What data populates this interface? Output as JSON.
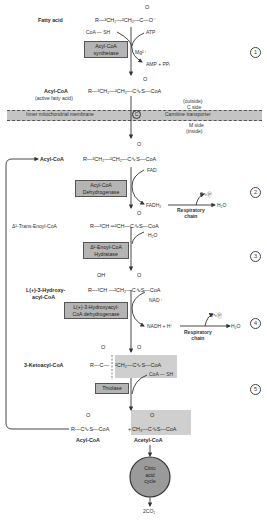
{
  "steps": [
    "1",
    "2",
    "3",
    "4",
    "5"
  ],
  "compounds": {
    "fatty_acid": {
      "label": "Fatty acid",
      "formula": "R—³CH₂—²CH₂—C—O⁻",
      "carbonyl": "O"
    },
    "acyl_coa_1": {
      "label": "Acyl-CoA",
      "sublabel": "(active fatty acid)",
      "formula": "R—³CH₂—²CH₂—C∿S—CoA",
      "carbonyl": "O"
    },
    "acyl_coa_2": {
      "label": "Acyl-CoA",
      "formula": "R—³CH₂—²CH₂—C∿S—CoA",
      "carbonyl": "O"
    },
    "trans_enoyl": {
      "label": "Δ²-Trans-Enoyl-CoA",
      "formula": "R—³CH ═²CH—C∿S—CoA",
      "carbonyl": "O"
    },
    "hydroxyacyl": {
      "label": "L(+)-3-Hydroxy-",
      "label2": "acyl-CoA",
      "formula": "R—³CH —²CH₂—C∿S—CoA",
      "oh": "OH",
      "carbonyl": "O"
    },
    "ketoacyl": {
      "label": "3-Ketoacyl-CoA",
      "formula_left": "R—C—",
      "formula_right": "²CH₂—C∿S—CoA",
      "carbonyl": "O"
    },
    "products": {
      "acyl": "R—C∿S—CoA",
      "plus": "+",
      "acetyl": "CH₃—C∿S—CoA",
      "acyl_label": "Acyl-CoA",
      "acetyl_label": "Acetyl-CoA",
      "carbonyl": "O"
    }
  },
  "enzymes": {
    "synthetase": [
      "Acyl-CoA",
      "synthetase"
    ],
    "dehydrogenase": [
      "Acyl-CoA",
      "Dehydrogenase"
    ],
    "hydratase": [
      "Δ²-Enoyl-CoA",
      "Hydratase"
    ],
    "hydroxy_dh": [
      "L(+)-3-Hydroxyacyl-",
      "CoA dehydrogenase"
    ],
    "thiolase": [
      "Thiolase"
    ]
  },
  "cofactors": {
    "coash_1": "CoA — SH",
    "atp": "ATP",
    "mg": "Mg²⁺",
    "amp": "AMP + PPᵢ",
    "fad": "FAD",
    "fadh2": "FADH₂",
    "h2o_1": "H₂O",
    "p2": "2∿Ⓟ",
    "resp_chain": [
      "Respiratory",
      "chain"
    ],
    "water_in": "H₂O",
    "nad": "NAD⁺",
    "nadh": "NADH + H⁺",
    "p3": "3∿Ⓟ",
    "h2o_2": "H₂O",
    "coash_2": "CoA — SH"
  },
  "membrane": {
    "left_label": "Inner mitochondrial membrane",
    "carrier": "C",
    "right_label": "Carnitine transporter",
    "outside": [
      "(outside)",
      "C side"
    ],
    "inside": [
      "M side",
      "(inside)"
    ]
  },
  "cycle": {
    "label": [
      "Citric",
      "acid",
      "cycle"
    ],
    "output": "2CO₂"
  }
}
